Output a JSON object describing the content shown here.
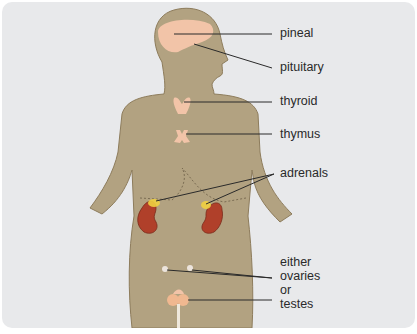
{
  "diagram": {
    "type": "anatomical-diagram",
    "colors": {
      "background": "#e8e9eb",
      "body": "#b2a281",
      "body_outline": "#8d7c5c",
      "gland_light": "#f2c4a8",
      "kidney": "#b0402a",
      "adrenal": "#f0d040",
      "leader_line": "#2a2a2a"
    },
    "labels": {
      "pineal": "pineal",
      "pituitary": "pituitary",
      "thyroid": "thyroid",
      "thymus": "thymus",
      "adrenals": "adrenals",
      "either": "either",
      "ovaries": "ovaries",
      "or": "or",
      "testes": "testes"
    }
  }
}
